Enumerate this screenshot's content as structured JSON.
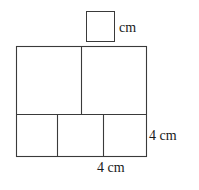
{
  "figure": {
    "stroke_color": "#3a3a3a",
    "fill_color": "#ffffff",
    "unknown_box": {
      "value": "",
      "placeholder": "",
      "unit_label": "cm"
    },
    "dimension_labels": {
      "right_side": "4 cm",
      "bottom_side": "4 cm"
    },
    "shapes": {
      "outer_square": {
        "x": 16,
        "y": 46,
        "width": 130,
        "height": 110
      },
      "unit_square": {
        "x": 86,
        "y": 11,
        "width": 28,
        "height": 30
      },
      "upper_divider_x": 81,
      "middle_divider_y": 114,
      "lower_divider_x1": 57,
      "lower_divider_x2": 103
    }
  }
}
